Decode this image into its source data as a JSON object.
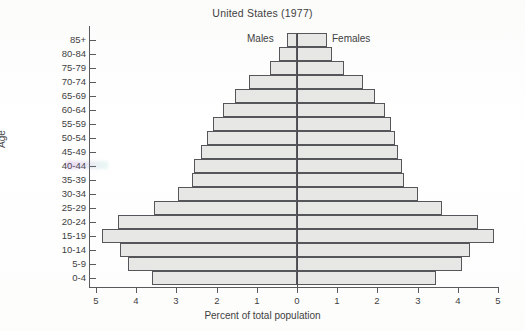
{
  "chart_data": {
    "type": "bar",
    "subtype": "population-pyramid",
    "title": "United States (1977)",
    "xlabel": "Percent of total population",
    "ylabel": "Age",
    "xlim": [
      -5,
      5
    ],
    "xtick_labels": [
      "5",
      "4",
      "3",
      "2",
      "1",
      "0",
      "1",
      "2",
      "3",
      "4",
      "5"
    ],
    "xtick_values": [
      -5,
      -4,
      -3,
      -2,
      -1,
      0,
      1,
      2,
      3,
      4,
      5
    ],
    "grid": false,
    "legend_position": "inside-top",
    "categories": [
      "85+",
      "80-84",
      "75-79",
      "70-74",
      "65-69",
      "60-64",
      "55-59",
      "50-54",
      "45-49",
      "40-44",
      "35-39",
      "30-34",
      "25-29",
      "20-24",
      "15-19",
      "10-14",
      "5-9",
      "0-4"
    ],
    "series": [
      {
        "name": "Males",
        "side": "left",
        "values": [
          0.26,
          0.45,
          0.67,
          1.2,
          1.55,
          1.85,
          2.1,
          2.25,
          2.4,
          2.55,
          2.6,
          2.95,
          3.55,
          4.45,
          4.85,
          4.4,
          4.2,
          3.6
        ]
      },
      {
        "name": "Females",
        "side": "right",
        "values": [
          0.75,
          0.88,
          1.16,
          1.64,
          1.95,
          2.2,
          2.35,
          2.45,
          2.5,
          2.6,
          2.65,
          3.0,
          3.6,
          4.5,
          4.9,
          4.3,
          4.1,
          3.45
        ]
      }
    ],
    "colors": {
      "bar_fill": "#e7e7e5",
      "bar_stroke": "#55565a",
      "axis": "#5a5a5c",
      "text": "#3f3f3f",
      "background": "#ffffff"
    }
  },
  "labels": {
    "males": "Males",
    "females": "Females"
  }
}
